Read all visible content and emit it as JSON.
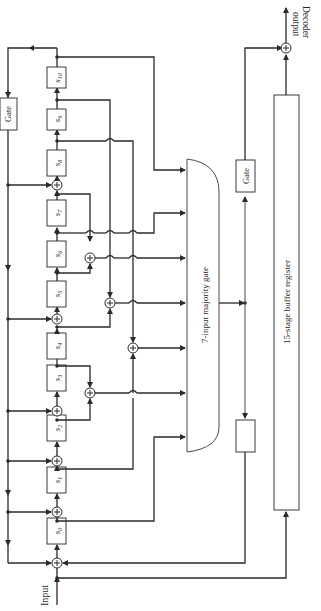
{
  "diagram": {
    "orientation": "rotated 90deg counter-clockwise",
    "labels": {
      "input": "Input",
      "decoder_output_line1": "Decoder",
      "decoder_output_line2": "output",
      "gate_top": "Gate",
      "gate_right_upper": "Gate",
      "gate_right_lower": "Gate",
      "majority_gate": "7-input majority gate",
      "buffer_register": "15-stage buffer register"
    },
    "registers": [
      {
        "id": "s0",
        "label": "s",
        "sub": "0"
      },
      {
        "id": "s1",
        "label": "s",
        "sub": "1"
      },
      {
        "id": "s2",
        "label": "s",
        "sub": "2"
      },
      {
        "id": "s3",
        "label": "s",
        "sub": "3"
      },
      {
        "id": "s4",
        "label": "s",
        "sub": "4"
      },
      {
        "id": "s5",
        "label": "s",
        "sub": "5"
      },
      {
        "id": "s6",
        "label": "s",
        "sub": "6"
      },
      {
        "id": "s7",
        "label": "s",
        "sub": "7"
      },
      {
        "id": "s8",
        "label": "s",
        "sub": "8"
      },
      {
        "id": "s9",
        "label": "s",
        "sub": "9"
      },
      {
        "id": "s10",
        "label": "s",
        "sub": "10"
      }
    ],
    "colors": {
      "line": "#2a2a2a",
      "background": "#ffffff"
    }
  }
}
